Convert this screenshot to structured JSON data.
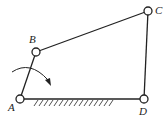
{
  "diagram": {
    "type": "four-bar linkage",
    "joints": [
      {
        "id": "A",
        "label": "A",
        "x": 20,
        "y": 99
      },
      {
        "id": "B",
        "label": "B",
        "x": 36,
        "y": 52
      },
      {
        "id": "C",
        "label": "C",
        "x": 148,
        "y": 11
      },
      {
        "id": "D",
        "label": "D",
        "x": 144,
        "y": 99
      }
    ],
    "links": [
      [
        "A",
        "B"
      ],
      [
        "B",
        "C"
      ],
      [
        "C",
        "D"
      ],
      [
        "A",
        "D"
      ]
    ],
    "ground": {
      "from": "A",
      "to": "D",
      "hatched": true
    },
    "rotation_arrow": {
      "around": "A",
      "direction": "clockwise"
    },
    "colors": {
      "line": "#222222",
      "joint_fill": "#ffffff"
    }
  }
}
